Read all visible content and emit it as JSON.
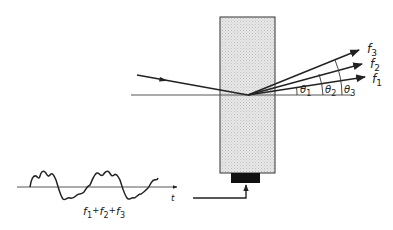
{
  "diagram": {
    "colors": {
      "ink": "#222222",
      "crystal_fill": "#e6e6e6",
      "crystal_hatch": "#c8c8c8",
      "transducer": "#111111",
      "background": "#ffffff"
    },
    "beams": [
      {
        "id": "f1",
        "label": "f",
        "sub": "1"
      },
      {
        "id": "f2",
        "label": "f",
        "sub": "2"
      },
      {
        "id": "f3",
        "label": "f",
        "sub": "3"
      }
    ],
    "angles": [
      {
        "id": "theta1",
        "label": "θ",
        "sub": "1"
      },
      {
        "id": "theta2",
        "label": "θ",
        "sub": "2"
      },
      {
        "id": "theta3",
        "label": "θ",
        "sub": "3"
      }
    ],
    "signal": {
      "time_axis_label": "t",
      "sum_label": {
        "parts": [
          {
            "label": "f",
            "sub": "1"
          },
          {
            "op": "+"
          },
          {
            "label": "f",
            "sub": "2"
          },
          {
            "op": "+"
          },
          {
            "label": "f",
            "sub": "3"
          }
        ]
      }
    }
  }
}
